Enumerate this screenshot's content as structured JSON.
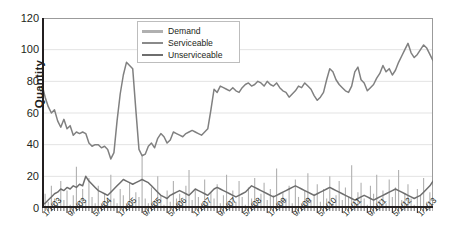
{
  "chart_data": {
    "type": "line",
    "title": "",
    "xlabel": "",
    "ylabel": "Quantity",
    "ylim": [
      0,
      120
    ],
    "yticks": [
      0,
      20,
      40,
      60,
      80,
      100,
      120
    ],
    "grid": true,
    "legend_position": "top-center",
    "xtick_labels": [
      "1/1/03",
      "9/1/03",
      "5/1/04",
      "1/1/05",
      "9/1/05",
      "5/1/06",
      "1/1/07",
      "9/1/07",
      "5/1/08",
      "1/1/09",
      "9/1/09",
      "5/1/10",
      "1/1/11",
      "9/1/11",
      "5/1/12",
      "1/1/13"
    ],
    "x_start": "1/1/2003",
    "x_end": "6/1/2013",
    "x_interval": "monthly",
    "n_points": 126,
    "colors": {
      "demand": "#b0b0b0",
      "serviceable": "#808080",
      "unserviceable": "#6e6e6e",
      "grid": "#e3e3e3",
      "axis": "#231f20"
    },
    "series": [
      {
        "name": "Demand",
        "style": "impulse",
        "color": "#b0b0b0",
        "values": [
          2,
          9,
          4,
          14,
          6,
          3,
          17,
          5,
          11,
          2,
          8,
          26,
          5,
          12,
          4,
          19,
          7,
          3,
          14,
          2,
          9,
          5,
          21,
          6,
          3,
          12,
          8,
          2,
          16,
          4,
          10,
          7,
          34,
          6,
          3,
          13,
          5,
          20,
          8,
          2,
          11,
          4,
          17,
          6,
          9,
          3,
          14,
          24,
          5,
          12,
          7,
          2,
          18,
          4,
          10,
          6,
          15,
          3,
          8,
          21,
          5,
          11,
          4,
          17,
          7,
          2,
          13,
          6,
          19,
          3,
          9,
          16,
          5,
          12,
          8,
          25,
          4,
          10,
          6,
          14,
          3,
          18,
          7,
          2,
          11,
          22,
          5,
          9,
          15,
          4,
          12,
          6,
          20,
          3,
          8,
          17,
          5,
          13,
          7,
          27,
          4,
          10,
          16,
          6,
          2,
          14,
          9,
          21,
          5,
          11,
          3,
          18,
          7,
          13,
          24,
          5,
          9,
          15,
          6,
          2,
          12,
          8,
          19,
          4,
          10,
          14
        ]
      },
      {
        "name": "Serviceable",
        "style": "line",
        "color": "#808080",
        "values": [
          78,
          70,
          64,
          60,
          62,
          55,
          51,
          56,
          50,
          52,
          46,
          48,
          47,
          48,
          47,
          41,
          39,
          40,
          40,
          38,
          39,
          37,
          31,
          35,
          55,
          72,
          84,
          92,
          90,
          88,
          62,
          37,
          33,
          34,
          39,
          41,
          38,
          44,
          47,
          45,
          41,
          43,
          48,
          47,
          46,
          45,
          47,
          48,
          49,
          48,
          47,
          46,
          48,
          50,
          62,
          75,
          73,
          77,
          76,
          75,
          74,
          76,
          74,
          73,
          76,
          78,
          79,
          77,
          78,
          80,
          79,
          77,
          80,
          78,
          77,
          79,
          76,
          74,
          73,
          70,
          72,
          74,
          77,
          76,
          79,
          77,
          75,
          71,
          68,
          70,
          73,
          81,
          88,
          86,
          81,
          78,
          76,
          74,
          73,
          77,
          86,
          89,
          81,
          79,
          74,
          76,
          78,
          82,
          85,
          90,
          86,
          88,
          84,
          87,
          92,
          96,
          100,
          104,
          98,
          95,
          97,
          100,
          103,
          101,
          97,
          93
        ]
      },
      {
        "name": "Unserviceable",
        "style": "line",
        "color": "#6e6e6e",
        "values": [
          2,
          3,
          5,
          7,
          9,
          10,
          12,
          11,
          13,
          12,
          14,
          13,
          15,
          14,
          20,
          17,
          15,
          13,
          11,
          10,
          9,
          8,
          10,
          12,
          14,
          16,
          18,
          17,
          16,
          15,
          16,
          17,
          18,
          17,
          16,
          14,
          12,
          10,
          8,
          7,
          6,
          8,
          9,
          10,
          11,
          10,
          9,
          8,
          10,
          12,
          11,
          10,
          9,
          8,
          10,
          12,
          13,
          12,
          11,
          10,
          9,
          8,
          7,
          8,
          9,
          10,
          12,
          14,
          13,
          12,
          11,
          10,
          9,
          8,
          7,
          8,
          9,
          10,
          11,
          12,
          13,
          14,
          13,
          12,
          11,
          10,
          9,
          8,
          9,
          10,
          11,
          12,
          13,
          12,
          11,
          10,
          9,
          8,
          7,
          6,
          5,
          6,
          7,
          8,
          7,
          6,
          5,
          6,
          7,
          8,
          9,
          10,
          11,
          12,
          11,
          10,
          9,
          8,
          7,
          6,
          7,
          8,
          10,
          12,
          14,
          17
        ]
      }
    ]
  },
  "legend": {
    "items": [
      {
        "label": "Demand"
      },
      {
        "label": "Serviceable"
      },
      {
        "label": "Unserviceable"
      }
    ]
  }
}
